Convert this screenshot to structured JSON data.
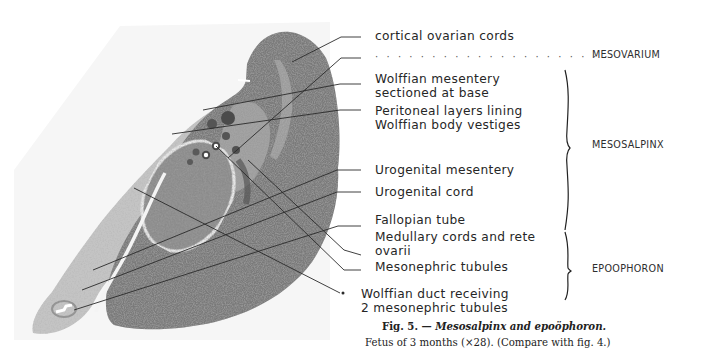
{
  "figure": {
    "number_label": "Fig. 5. —",
    "title": "Mesosalpinx and epoöphoron.",
    "subtitle": "Fetus of 3 months (×28).  (Compare with fig. 4.)"
  },
  "labels": [
    {
      "id": "cortical",
      "lines": [
        "cortical ovarian cords"
      ]
    },
    {
      "id": "dotted",
      "lines": [
        "· · · · · · · · · · · · · · · · · · · · ·"
      ]
    },
    {
      "id": "wolffian-mesentery",
      "lines": [
        "Wolffian mesentery",
        "sectioned at base"
      ]
    },
    {
      "id": "peritoneal",
      "lines": [
        "Peritoneal layers lining",
        "Wolffian body vestiges"
      ]
    },
    {
      "id": "urogenital-mesentery",
      "lines": [
        "Urogenital  mesentery"
      ]
    },
    {
      "id": "urogenital-cord",
      "lines": [
        "Urogenital cord"
      ]
    },
    {
      "id": "fallopian",
      "lines": [
        "Fallopian tube"
      ]
    },
    {
      "id": "medullary",
      "lines": [
        "Medullary cords and rete",
        "ovarii"
      ]
    },
    {
      "id": "mesonephric",
      "lines": [
        "Mesonephric tubules"
      ]
    },
    {
      "id": "wolffian-duct",
      "lines": [
        "Wolffian duct receiving",
        "2 mesonephric tubules"
      ]
    }
  ],
  "regions": [
    {
      "id": "mesovarium",
      "label": "MESOVARIUM"
    },
    {
      "id": "mesosalpinx",
      "label": "MESOSALPINX"
    },
    {
      "id": "epoophoron",
      "label": "EPOOPHORON"
    }
  ],
  "colors": {
    "tissue_dark": "#7d7d7d",
    "tissue_light": "#c9c9c9",
    "leader": "#2a2a2a"
  }
}
